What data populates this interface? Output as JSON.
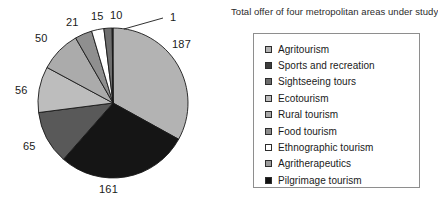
{
  "chart_data": {
    "type": "pie",
    "title": "Total offer of four metropolitan areas under study",
    "xlabel": "",
    "ylabel": "",
    "legend_position": "right",
    "grid": false,
    "total": 566,
    "categories": [
      "Agritourism",
      "Sports and recreation",
      "Sightseeing tours",
      "Ecotourism",
      "Rural tourism",
      "Food tourism",
      "Ethnographic tourism",
      "Agritherapeutics",
      "Pilgrimage tourism"
    ],
    "values": [
      187,
      1,
      10,
      15,
      21,
      50,
      56,
      65,
      161
    ],
    "colors": [
      "#b3b3b3",
      "#3d3d3d",
      "#6b6b6b",
      "#bdbdbd",
      "#a8a8a8",
      "#8c8c8c",
      "#ffffff",
      "#9c9c9c",
      "#111111"
    ],
    "slices": [
      {
        "label": "Agritourism",
        "value": 187,
        "data_label": "187",
        "color": "#b3b3b3"
      },
      {
        "label": "Pilgrimage tourism",
        "value": 161,
        "data_label": "161",
        "color": "#151515"
      },
      {
        "label": "Food tourism",
        "value": 65,
        "data_label": "65",
        "color": "#595959"
      },
      {
        "label": "Ecotourism",
        "value": 56,
        "data_label": "56",
        "color": "#bdbdbd"
      },
      {
        "label": "Rural tourism",
        "value": 50,
        "data_label": "50",
        "color": "#ababab"
      },
      {
        "label": "Agritherapeutics",
        "value": 21,
        "data_label": "21",
        "color": "#8f8f8f"
      },
      {
        "label": "Ethnographic tourism",
        "value": 15,
        "data_label": "15",
        "color": "#ffffff"
      },
      {
        "label": "Sightseeing tours",
        "value": 10,
        "data_label": "10",
        "color": "#6e6e6e"
      },
      {
        "label": "Sports and recreation",
        "value": 1,
        "data_label": "1",
        "color": "#3d3d3d"
      }
    ],
    "data_labels": [
      "187",
      "161",
      "65",
      "56",
      "50",
      "21",
      "15",
      "10",
      "1"
    ]
  },
  "legend": {
    "items": [
      {
        "label": "Agritourism",
        "swatch": "#b3b3b3"
      },
      {
        "label": "Sports and recreation",
        "swatch": "#3d3d3d"
      },
      {
        "label": "Sightseeing tours",
        "swatch": "#6b6b6b"
      },
      {
        "label": "Ecotourism",
        "swatch": "#bdbdbd"
      },
      {
        "label": "Rural tourism",
        "swatch": "#a8a8a8"
      },
      {
        "label": "Food tourism",
        "swatch": "#8c8c8c"
      },
      {
        "label": "Ethnographic tourism",
        "swatch": "#ffffff"
      },
      {
        "label": "Agritherapeutics",
        "swatch": "#9c9c9c"
      },
      {
        "label": "Pilgrimage tourism",
        "swatch": "#111111"
      }
    ]
  }
}
